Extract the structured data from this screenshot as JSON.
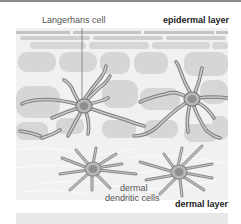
{
  "labels": {
    "langerhans": "Langerhans cell",
    "epidermal": "epidermal layer",
    "dermal_dendritic_line1": "dermal",
    "dermal_dendritic_line2": "dendritic cells",
    "dermal": "dermal layer"
  },
  "colors": {
    "background": "#ffffff",
    "panel": "#f1f1f1",
    "epidermal_cell": "#d6d6d6",
    "stratum_band": "#c4c4c4",
    "dendrite_outer": "#7d7d7d",
    "dendrite_inner": "#c9c9c9",
    "nucleus": "#8f8f8f",
    "text": "#555555",
    "text_bold": "#222222"
  }
}
